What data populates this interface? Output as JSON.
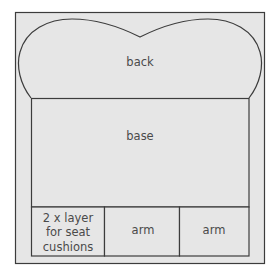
{
  "diagram": {
    "pieces": {
      "back": "back",
      "base": "base",
      "cushions": [
        "2 x layer",
        "for seat",
        "cushions"
      ],
      "arm1": "arm",
      "arm2": "arm"
    },
    "colors": {
      "fill": "#e6e6e6",
      "stroke": "#3c3c3c",
      "text": "#4a4a4a"
    }
  }
}
